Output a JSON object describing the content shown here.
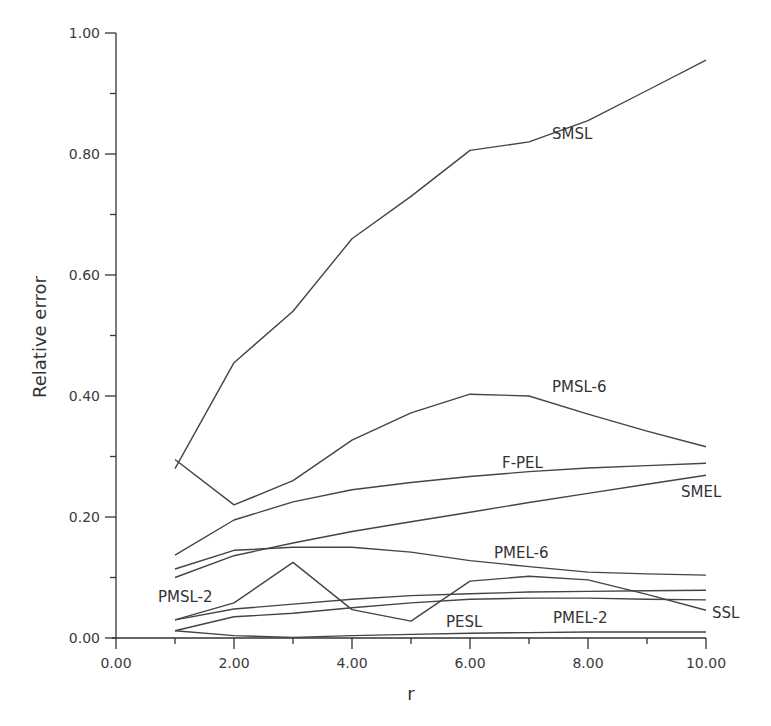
{
  "chart_data": {
    "type": "line",
    "title": "",
    "xlabel": "r",
    "ylabel": "Relative error",
    "xlim": [
      0,
      10
    ],
    "ylim": [
      0,
      1
    ],
    "x_ticks": [
      "0.00",
      "2.00",
      "4.00",
      "6.00",
      "8.00",
      "10.00"
    ],
    "y_ticks": [
      "0.00",
      "0.20",
      "0.40",
      "0.60",
      "0.80",
      "1.00"
    ],
    "grid": false,
    "legend": "inline labels",
    "x": [
      1,
      2,
      3,
      4,
      5,
      6,
      7,
      8,
      9,
      10
    ],
    "series": [
      {
        "name": "SMSL",
        "values": [
          0.28,
          0.455,
          0.54,
          0.66,
          0.73,
          0.806,
          0.82,
          0.855,
          0.905,
          0.955
        ],
        "label_pos": [
          552,
          139
        ]
      },
      {
        "name": "PMSL-6",
        "values": [
          0.295,
          0.22,
          0.26,
          0.327,
          0.372,
          0.403,
          0.4,
          0.37,
          0.342,
          0.316
        ],
        "label_pos": [
          552,
          392
        ]
      },
      {
        "name": "F-PEL",
        "values": [
          0.137,
          0.195,
          0.225,
          0.245,
          0.257,
          0.267,
          0.275,
          0.281,
          0.285,
          0.289
        ],
        "label_pos": [
          502,
          468
        ]
      },
      {
        "name": "SMEL",
        "values": [
          0.1,
          0.136,
          0.157,
          0.176,
          0.192,
          0.208,
          0.224,
          0.239,
          0.254,
          0.269
        ],
        "label_pos": [
          681,
          497
        ]
      },
      {
        "name": "PMEL-6",
        "values": [
          0.114,
          0.145,
          0.15,
          0.15,
          0.142,
          0.128,
          0.118,
          0.109,
          0.106,
          0.104
        ],
        "label_pos": [
          494,
          558
        ]
      },
      {
        "name": "SSL",
        "values": [
          0.03,
          0.048,
          0.056,
          0.064,
          0.07,
          0.073,
          0.076,
          0.077,
          0.078,
          0.079
        ],
        "label_pos": [
          712,
          618
        ]
      },
      {
        "name": "PMSL-2",
        "values": [
          0.03,
          0.058,
          0.125,
          0.047,
          0.028,
          0.094,
          0.102,
          0.096,
          0.072,
          0.046
        ],
        "label_pos": [
          158,
          602
        ]
      },
      {
        "name": "PMEL-2",
        "values": [
          0.012,
          0.035,
          0.041,
          0.05,
          0.058,
          0.064,
          0.066,
          0.066,
          0.064,
          0.063
        ],
        "label_pos": [
          553,
          623
        ]
      },
      {
        "name": "PESL",
        "values": [
          0.012,
          0.004,
          0.001,
          0.004,
          0.006,
          0.008,
          0.009,
          0.01,
          0.01,
          0.01
        ],
        "label_pos": [
          446,
          627
        ]
      }
    ]
  }
}
